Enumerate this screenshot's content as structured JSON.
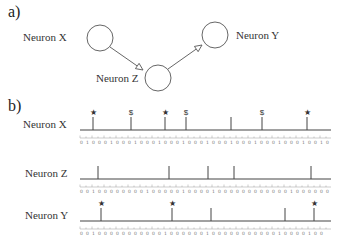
{
  "part_a": {
    "label": "a)",
    "neurons": [
      {
        "id": "X",
        "label": "Neuron X",
        "cx": 100,
        "cy": 38,
        "r": 13,
        "label_x": 23,
        "label_y": 31
      },
      {
        "id": "Z",
        "label": "Neuron Z",
        "cx": 158,
        "cy": 78,
        "r": 13,
        "label_x": 96,
        "label_y": 72
      },
      {
        "id": "Y",
        "label": "Neuron Y",
        "cx": 215,
        "cy": 35,
        "r": 13,
        "label_x": 236,
        "label_y": 29
      }
    ],
    "connections": [
      {
        "from": "X",
        "to": "Z",
        "x1": 110,
        "y1": 47,
        "x2": 143,
        "y2": 70
      },
      {
        "from": "Z",
        "to": "Y",
        "x1": 168,
        "y1": 69,
        "x2": 202,
        "y2": 45
      }
    ]
  },
  "part_b": {
    "label": "b)",
    "axis": {
      "x_start": 80,
      "x_end": 331,
      "tick_step": 6,
      "tick_count": 42
    },
    "rows": [
      {
        "name": "Neuron X",
        "baseline_y": 130,
        "spikes": [
          {
            "x": 93,
            "marker": "*"
          },
          {
            "x": 131,
            "marker": "$"
          },
          {
            "x": 165,
            "marker": "*"
          },
          {
            "x": 186,
            "marker": "$"
          },
          {
            "x": 231,
            "marker": ""
          },
          {
            "x": 262,
            "marker": "$"
          },
          {
            "x": 307,
            "marker": "*"
          }
        ],
        "digits": "0100010001000100010001000100010001000100 10"
      },
      {
        "name": "Neuron Z",
        "baseline_y": 179,
        "spikes": [
          {
            "x": 98,
            "marker": ""
          },
          {
            "x": 169,
            "marker": ""
          },
          {
            "x": 208,
            "marker": ""
          },
          {
            "x": 234,
            "marker": ""
          },
          {
            "x": 311,
            "marker": ""
          }
        ],
        "digits": "001000000001000001000010000000000001 000000"
      },
      {
        "name": "Neuron Y",
        "baseline_y": 221,
        "spikes": [
          {
            "x": 101,
            "marker": "*"
          },
          {
            "x": 172,
            "marker": "*"
          },
          {
            "x": 211,
            "marker": ""
          },
          {
            "x": 285,
            "marker": ""
          },
          {
            "x": 314,
            "marker": "*"
          }
        ],
        "digits": "0010000000000010000001000000000001000010 0"
      }
    ]
  }
}
